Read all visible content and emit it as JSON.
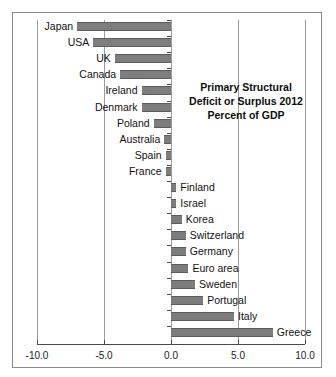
{
  "figure": {
    "background_color": "#ffffff",
    "frame_color": "#8a8a8a",
    "bar_color": "#7d7d7d",
    "bar_edge_color": "#5c5c5c",
    "grid_color": "#9a9a9a",
    "axis_color": "#4a4a4a"
  },
  "title": {
    "line1": "Primary Structural",
    "line2": "Deficit or Surplus 2012",
    "line3": "Percent of GDP"
  },
  "chart_data": {
    "type": "bar",
    "orientation": "horizontal",
    "title": "Primary Structural Deficit or Surplus 2012 Percent of GDP",
    "xlabel": "",
    "ylabel": "",
    "xlim": [
      -10.0,
      10.0
    ],
    "ylim": [
      0,
      21
    ],
    "grid": true,
    "gridlines_x": [
      -10.0,
      -5.0,
      0.0,
      5.0,
      10.0
    ],
    "legend": null,
    "xticks": [
      -10.0,
      -5.0,
      0.0,
      5.0,
      10.0
    ],
    "xticklabels": [
      "-10.0",
      "-5.0",
      "0.0",
      "5.0",
      "10.0"
    ],
    "categories": [
      "Japan",
      "USA",
      "UK",
      "Canada",
      "Ireland",
      "Denmark",
      "Poland",
      "Australia",
      "Spain",
      "France",
      "Finland",
      "Israel",
      "Korea",
      "Switzerland",
      "Germany",
      "Euro area",
      "Sweden",
      "Portugal",
      "Italy",
      "Greece"
    ],
    "values": [
      -7.0,
      -5.8,
      -4.2,
      -3.8,
      -2.2,
      -2.2,
      -1.3,
      -0.5,
      -0.4,
      -0.4,
      0.4,
      0.4,
      0.8,
      1.1,
      1.1,
      1.3,
      1.8,
      2.4,
      4.7,
      7.6
    ]
  }
}
